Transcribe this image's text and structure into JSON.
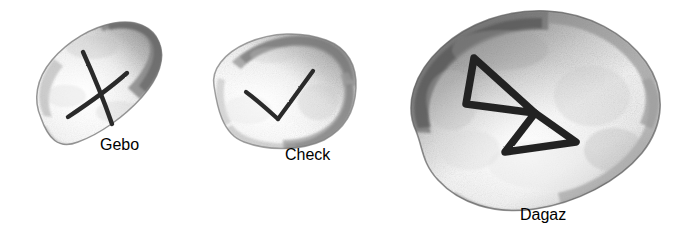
{
  "scene": {
    "title": "Three hand-drawn rune stones",
    "background_color": "#ffffff",
    "width": 225,
    "medium": "pencil / graphite drawing",
    "stone_count": 3
  },
  "stones": [
    {
      "id": "stone-left",
      "label": "Left rune stone",
      "shape": "elongated rounded oval, tilted up to the right",
      "rotation_degrees": -34,
      "rune_name": "Gebo",
      "rune_symbol": "X",
      "rune_description": "X-shaped cross of two crossing strokes",
      "body_fill_light": "#fcfcfc",
      "body_fill_mid": "#e3e3e3",
      "body_fill_shadow": "#8f8f8f",
      "edge_color": "#6f6f6f",
      "mark_color": "#2b2b2b"
    },
    {
      "id": "stone-middle",
      "label": "Middle rune stone",
      "shape": "rounded quadrilateral pebble",
      "rotation_degrees": -4,
      "rune_name": "Check",
      "rune_symbol": "V",
      "rune_description": "check mark with short left arm and long right arm",
      "body_fill_light": "#fdfdfd",
      "body_fill_mid": "#e8e8e8",
      "body_fill_shadow": "#9a9a9a",
      "edge_color": "#777777",
      "mark_color": "#2b2b2b"
    },
    {
      "id": "stone-right",
      "label": "Right rune stone",
      "shape": "large rounded rectangle pebble, tilted up to the right",
      "rotation_degrees": -24,
      "rune_name": "Dagaz",
      "rune_symbol": "M",
      "rune_description": "two triangles joined at a central point, bow-tie like",
      "body_fill_light": "#fbfbfb",
      "body_fill_mid": "#d9d9d9",
      "body_fill_shadow": "#7a7a7a",
      "edge_color": "#5e5e5e",
      "mark_color": "#242424"
    }
  ]
}
